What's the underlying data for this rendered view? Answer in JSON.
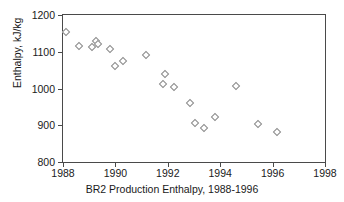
{
  "chart_data": {
    "type": "scatter",
    "title": "",
    "xlabel": "BR2 Production Enthalpy, 1988-1996",
    "ylabel": "Enthalpy, kJ/kg",
    "xlim": [
      1988,
      1998
    ],
    "ylim": [
      800,
      1200
    ],
    "xticks": [
      1988,
      1990,
      1992,
      1994,
      1996,
      1998
    ],
    "xtick_labels": [
      "1988",
      "1990",
      "1992",
      "1994",
      "1996",
      "1998"
    ],
    "yticks": [
      800,
      900,
      1000,
      1100,
      1200
    ],
    "ytick_labels": [
      "800",
      "900",
      "1000",
      "1100",
      "1200"
    ],
    "grid": false,
    "legend": null,
    "marker": "open-diamond",
    "marker_color": "#8a8a8a",
    "series": [
      {
        "name": "BR2 Production Enthalpy",
        "points": [
          {
            "x": 1988.1,
            "y": 1155
          },
          {
            "x": 1988.6,
            "y": 1115
          },
          {
            "x": 1989.1,
            "y": 1113
          },
          {
            "x": 1989.25,
            "y": 1128
          },
          {
            "x": 1989.35,
            "y": 1122
          },
          {
            "x": 1989.8,
            "y": 1107
          },
          {
            "x": 1990.0,
            "y": 1060
          },
          {
            "x": 1990.3,
            "y": 1076
          },
          {
            "x": 1991.15,
            "y": 1092
          },
          {
            "x": 1991.8,
            "y": 1011
          },
          {
            "x": 1991.9,
            "y": 1040
          },
          {
            "x": 1992.25,
            "y": 1005
          },
          {
            "x": 1992.85,
            "y": 961
          },
          {
            "x": 1993.05,
            "y": 907
          },
          {
            "x": 1993.4,
            "y": 892
          },
          {
            "x": 1993.8,
            "y": 922
          },
          {
            "x": 1994.6,
            "y": 1007
          },
          {
            "x": 1995.45,
            "y": 903
          },
          {
            "x": 1996.15,
            "y": 882
          }
        ]
      }
    ]
  },
  "axes": {
    "x_title": "BR2 Production Enthalpy, 1988-1996",
    "y_title": "Enthalpy, kJ/kg"
  }
}
